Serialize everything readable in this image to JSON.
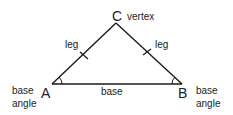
{
  "diagram": {
    "vertices": {
      "A": {
        "label": "A",
        "x": 52,
        "y": 84
      },
      "B": {
        "label": "B",
        "x": 182,
        "y": 84
      },
      "C": {
        "label": "C",
        "x": 116,
        "y": 23
      }
    },
    "labels": {
      "vertex": "vertex",
      "leg_left": "leg",
      "leg_right": "leg",
      "base": "base",
      "base_angle_left_1": "base",
      "base_angle_left_2": "angle",
      "base_angle_right_1": "base",
      "base_angle_right_2": "angle"
    },
    "colors": {
      "stroke": "#1a1a1a",
      "background": "#ffffff"
    }
  }
}
